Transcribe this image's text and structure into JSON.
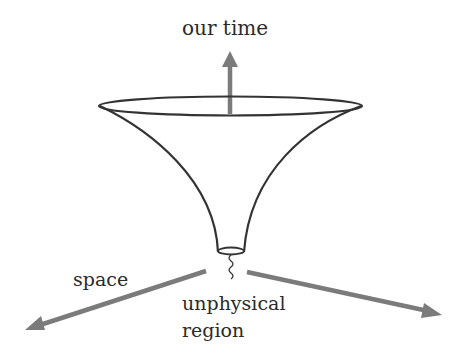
{
  "diagram": {
    "labels": {
      "time_axis": "our time",
      "space_axis": "space",
      "bottom_region_line1": "unphysical",
      "bottom_region_line2": "region"
    },
    "colors": {
      "outline": "#333333",
      "axis_arrow": "#7b7b7b",
      "text": "#2a2a2a",
      "background": "#ffffff"
    },
    "shapes": [
      "funnel-trumpet",
      "top-rim-ellipse",
      "bottom-neck-ellipse",
      "squiggle-line",
      "time-arrow",
      "space-arrow-left",
      "space-arrow-right"
    ]
  }
}
